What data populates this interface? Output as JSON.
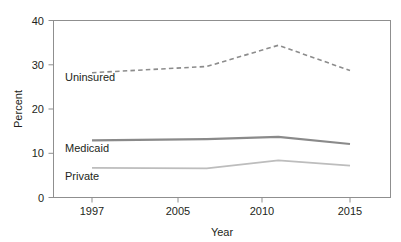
{
  "chart_data": {
    "type": "line",
    "title": "",
    "xlabel": "Year",
    "ylabel": "Percent",
    "x": [
      1997,
      2005,
      2010,
      2015
    ],
    "categories": [
      "1997",
      "2005",
      "2010",
      "2015"
    ],
    "xtick_labels": [
      "1997",
      "2005",
      "2010",
      "2015"
    ],
    "ytick_labels": [
      "0",
      "10",
      "20",
      "30",
      "40"
    ],
    "ytick_values": [
      0,
      10,
      20,
      30,
      40
    ],
    "ylim": [
      0,
      40
    ],
    "xlim": [
      1995,
      2018
    ],
    "grid": false,
    "legend_position": "inline-labels",
    "series": [
      {
        "name": "Uninsured",
        "label": "Uninsured",
        "values": [
          28.2,
          29.6,
          34.4,
          28.7
        ],
        "style": "dashed",
        "color": "#8c8c8c",
        "width": 1.6
      },
      {
        "name": "Medicaid",
        "label": "Medicaid",
        "values": [
          12.9,
          13.2,
          13.7,
          12.1
        ],
        "style": "solid",
        "color": "#8a8a8a",
        "width": 2.1
      },
      {
        "name": "Private",
        "label": "Private",
        "values": [
          6.7,
          6.6,
          8.4,
          7.2
        ],
        "style": "solid",
        "color": "#bdbdbd",
        "width": 1.7
      }
    ],
    "annotations": [
      {
        "text": "Uninsured",
        "series": "Uninsured",
        "x": 1997,
        "y": 28.2
      },
      {
        "text": "Medicaid",
        "series": "Medicaid",
        "x": 1997,
        "y": 12.9
      },
      {
        "text": "Private",
        "series": "Private",
        "x": 1997,
        "y": 6.7
      }
    ],
    "colors": {
      "axis": "#6e6e6e",
      "frame": "#8a8a8a",
      "text": "#231f20",
      "background": "#ffffff",
      "uninsured": "#8c8c8c",
      "medicaid": "#8a8a8a",
      "private": "#bdbdbd"
    }
  },
  "axes": {
    "y_title": "Percent",
    "x_title": "Year",
    "y_ticks": [
      {
        "label": "40"
      },
      {
        "label": "30"
      },
      {
        "label": "20"
      },
      {
        "label": "10"
      },
      {
        "label": "0"
      }
    ],
    "x_ticks": [
      {
        "label": "1997"
      },
      {
        "label": "2005"
      },
      {
        "label": "2010"
      },
      {
        "label": "2015"
      }
    ]
  },
  "series_labels": {
    "uninsured": "Uninsured",
    "medicaid": "Medicaid",
    "private": "Private"
  }
}
